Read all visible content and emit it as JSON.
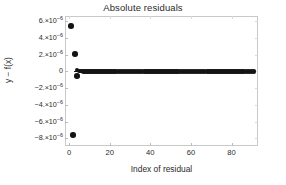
{
  "chart_data": {
    "type": "scatter",
    "title": "Absolute residuals",
    "xlabel": "Index of residual",
    "ylabel": "y − f(x)",
    "xlim": [
      -2,
      93
    ],
    "ylim": [
      -8.9e-06,
      6.6e-06
    ],
    "grid": false,
    "legend": null,
    "marker": "filled-circle",
    "marker_color": "#141414",
    "xticks": [
      0,
      20,
      40,
      60,
      80
    ],
    "xtick_labels": [
      "0",
      "20",
      "40",
      "60",
      "80"
    ],
    "yticks": [
      6e-06,
      4e-06,
      2e-06,
      0,
      -2e-06,
      -4e-06,
      -6e-06,
      -8e-06
    ],
    "ytick_labels": [
      {
        "mantissa": "6.×10",
        "exp": "-6"
      },
      {
        "mantissa": "4.×10",
        "exp": "-6"
      },
      {
        "mantissa": "2.×10",
        "exp": "-6"
      },
      {
        "mantissa": "0",
        "exp": ""
      },
      {
        "mantissa": "-2.×10",
        "exp": "-6"
      },
      {
        "mantissa": "-4.×10",
        "exp": "-6"
      },
      {
        "mantissa": "-6.×10",
        "exp": "-6"
      },
      {
        "mantissa": "-8.×10",
        "exp": "-6"
      }
    ],
    "x": [
      1,
      2,
      3,
      4,
      4,
      5,
      6,
      7,
      8,
      9,
      10,
      11,
      12,
      13,
      14,
      15,
      16,
      17,
      18,
      19,
      20,
      21,
      22,
      23,
      24,
      25,
      26,
      27,
      28,
      29,
      30,
      31,
      32,
      33,
      34,
      35,
      36,
      37,
      38,
      39,
      40,
      41,
      42,
      43,
      44,
      45,
      46,
      47,
      48,
      49,
      50,
      51,
      52,
      53,
      54,
      55,
      56,
      57,
      58,
      59,
      60,
      61,
      62,
      63,
      64,
      65,
      66,
      67,
      68,
      69,
      70,
      71,
      72,
      73,
      74,
      75,
      76,
      77,
      78,
      79,
      80,
      81,
      82,
      83,
      84,
      85,
      86,
      87,
      88,
      89,
      90,
      91
    ],
    "y": [
      5.4e-06,
      -7.6e-06,
      2.1e-06,
      -5.5e-07,
      1.5e-07,
      5e-08,
      2e-08,
      1e-08,
      5e-09,
      2e-09,
      1e-09,
      5e-10,
      2e-10,
      1e-10,
      5e-11,
      2e-11,
      1e-11,
      5e-12,
      2e-12,
      1e-12,
      5e-13,
      2e-13,
      1e-13,
      5e-14,
      2e-14,
      1e-14,
      5e-15,
      2e-15,
      1e-15,
      5e-16,
      2e-16,
      1e-16,
      5e-17,
      2e-17,
      1e-17,
      5e-18,
      2e-18,
      1e-18,
      5e-19,
      2e-19,
      1e-19,
      5e-20,
      2e-20,
      1e-20,
      5e-21,
      2e-21,
      1e-21,
      5e-22,
      2e-22,
      1e-22,
      5e-23,
      2e-23,
      1e-23,
      5e-24,
      2e-24,
      1e-24,
      5e-25,
      2e-25,
      1e-25,
      5e-26,
      2e-26,
      1e-26,
      5e-27,
      2e-27,
      1e-27,
      5e-28,
      2e-28,
      1e-28,
      5e-29,
      2e-29,
      1e-29,
      5e-30,
      2e-30,
      1e-30,
      5e-31,
      2e-31,
      1e-31,
      5e-32,
      2e-32,
      1e-32,
      5e-33,
      2e-33,
      1e-33,
      5e-34,
      2e-34,
      1e-34,
      5e-35,
      2e-35,
      1e-35,
      5e-36,
      2e-36,
      1e-36
    ],
    "outliers": [
      {
        "index": 1,
        "value": 5.4e-06
      },
      {
        "index": 2,
        "value": -7.6e-06
      },
      {
        "index": 3,
        "value": 2.1e-06
      },
      {
        "index": 4,
        "value": -5.5e-07
      }
    ],
    "note": "Dense cluster of residuals at y≈0 spanning indices 4-91; three large outliers at low indices."
  }
}
